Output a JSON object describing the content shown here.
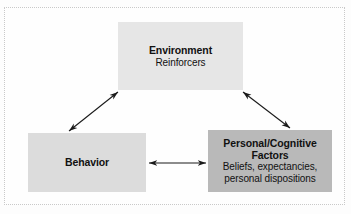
{
  "figure": {
    "kind": "reciprocal-determinism-diagram",
    "background_color": "#fdfdfd",
    "frame": {
      "style": "dotted",
      "color": "#c9c9c9"
    }
  },
  "nodes": {
    "environment": {
      "title": "Environment",
      "subtitle": "Reinforcers",
      "fill_color": "#e6e6e6",
      "text_color": "#111111"
    },
    "behavior": {
      "title": "Behavior",
      "fill_color": "#dcdcdc",
      "text_color": "#111111"
    },
    "personal": {
      "title_line1": "Personal/Cognitive",
      "title_line2": "Factors",
      "subtitle_line1": "Beliefs, expectancies,",
      "subtitle_line2": "personal dispositions",
      "fill_color": "#b9b9b9",
      "text_color": "#111111"
    }
  },
  "connectors": [
    {
      "name": "behavior-environment",
      "from": "behavior",
      "to": "environment",
      "style": "double-headed-arrow",
      "color": "#1a1a1a"
    },
    {
      "name": "environment-personal",
      "from": "environment",
      "to": "personal",
      "style": "double-headed-arrow",
      "color": "#1a1a1a"
    },
    {
      "name": "behavior-personal",
      "from": "behavior",
      "to": "personal",
      "style": "double-headed-arrow",
      "color": "#1a1a1a"
    }
  ]
}
